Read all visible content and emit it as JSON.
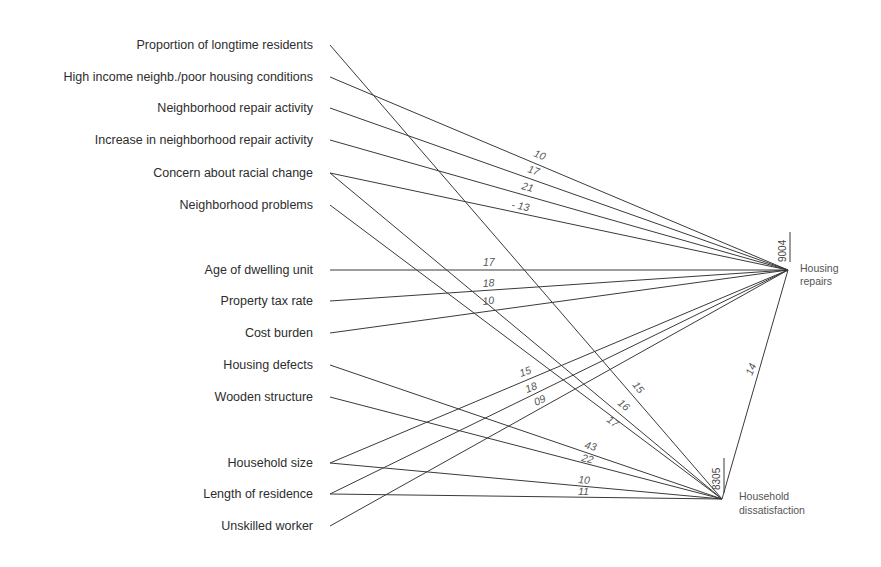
{
  "diagram": {
    "type": "path-diagram",
    "predictors": [
      {
        "id": "p0",
        "label": "Proportion of longtime residents",
        "y": 45
      },
      {
        "id": "p1",
        "label": "High income neighb./poor housing conditions",
        "y": 77
      },
      {
        "id": "p2",
        "label": "Neighborhood repair activity",
        "y": 108
      },
      {
        "id": "p3",
        "label": "Increase in neighborhood repair activity",
        "y": 140
      },
      {
        "id": "p4",
        "label": "Concern about racial change",
        "y": 173
      },
      {
        "id": "p5",
        "label": "Neighborhood problems",
        "y": 205
      },
      {
        "id": "p6",
        "label": "Age of dwelling unit",
        "y": 270
      },
      {
        "id": "p7",
        "label": "Property tax rate",
        "y": 301
      },
      {
        "id": "p8",
        "label": "Cost burden",
        "y": 333
      },
      {
        "id": "p9",
        "label": "Housing defects",
        "y": 365
      },
      {
        "id": "p10",
        "label": "Wooden structure",
        "y": 397
      },
      {
        "id": "p11",
        "label": "Household size",
        "y": 463
      },
      {
        "id": "p12",
        "label": "Length of residence",
        "y": 494
      },
      {
        "id": "p13",
        "label": "Unskilled worker",
        "y": 526
      }
    ],
    "outcomes": {
      "repairs": {
        "label_line1": "Housing",
        "label_line2": "repairs",
        "r_squared_label": "9004",
        "x": 788,
        "y": 270
      },
      "dissatisfaction": {
        "label_line1": "Household",
        "label_line2": "dissatisfaction",
        "r_squared_label": "8305",
        "x": 722,
        "y": 499
      }
    },
    "paths": [
      {
        "from": "p0",
        "to": "dissatisfaction",
        "coef": "15",
        "lx": 632,
        "ly": 385,
        "rot": 52
      },
      {
        "from": "p1",
        "to": "repairs",
        "coef": "10",
        "lx": 533,
        "ly": 156,
        "rot": 22
      },
      {
        "from": "p2",
        "to": "repairs",
        "coef": "17",
        "lx": 527,
        "ly": 172,
        "rot": 18
      },
      {
        "from": "p3",
        "to": "repairs",
        "coef": "21",
        "lx": 521,
        "ly": 189,
        "rot": 15
      },
      {
        "from": "p4",
        "to": "repairs",
        "coef": "- 13",
        "lx": 511,
        "ly": 208,
        "rot": 10
      },
      {
        "from": "p4",
        "to": "dissatisfaction",
        "coef": "16",
        "lx": 617,
        "ly": 404,
        "rot": 40
      },
      {
        "from": "p5",
        "to": "dissatisfaction",
        "coef": "17",
        "lx": 606,
        "ly": 421,
        "rot": 36
      },
      {
        "from": "p6",
        "to": "repairs",
        "coef": "17",
        "lx": 483,
        "ly": 266,
        "rot": 0
      },
      {
        "from": "p7",
        "to": "repairs",
        "coef": "18",
        "lx": 483,
        "ly": 287,
        "rot": -4
      },
      {
        "from": "p8",
        "to": "repairs",
        "coef": "10",
        "lx": 483,
        "ly": 305,
        "rot": -7
      },
      {
        "from": "p9",
        "to": "dissatisfaction",
        "coef": "43",
        "lx": 584,
        "ly": 448,
        "rot": 15
      },
      {
        "from": "p10",
        "to": "dissatisfaction",
        "coef": "22",
        "lx": 581,
        "ly": 461,
        "rot": 13
      },
      {
        "from": "p11",
        "to": "repairs",
        "coef": "15",
        "lx": 521,
        "ly": 377,
        "rot": -20
      },
      {
        "from": "p11",
        "to": "dissatisfaction",
        "coef": "10",
        "lx": 578,
        "ly": 483,
        "rot": 5
      },
      {
        "from": "p12",
        "to": "repairs",
        "coef": "18",
        "lx": 527,
        "ly": 393,
        "rot": -22
      },
      {
        "from": "p12",
        "to": "dissatisfaction",
        "coef": "11",
        "lx": 578,
        "ly": 495,
        "rot": 1
      },
      {
        "from": "p13",
        "to": "repairs",
        "coef": "09",
        "lx": 536,
        "ly": 406,
        "rot": -25
      },
      {
        "from": "dissatisfaction",
        "to": "repairs",
        "coef": "14",
        "lx": 752,
        "ly": 376,
        "rot": -68
      }
    ]
  }
}
